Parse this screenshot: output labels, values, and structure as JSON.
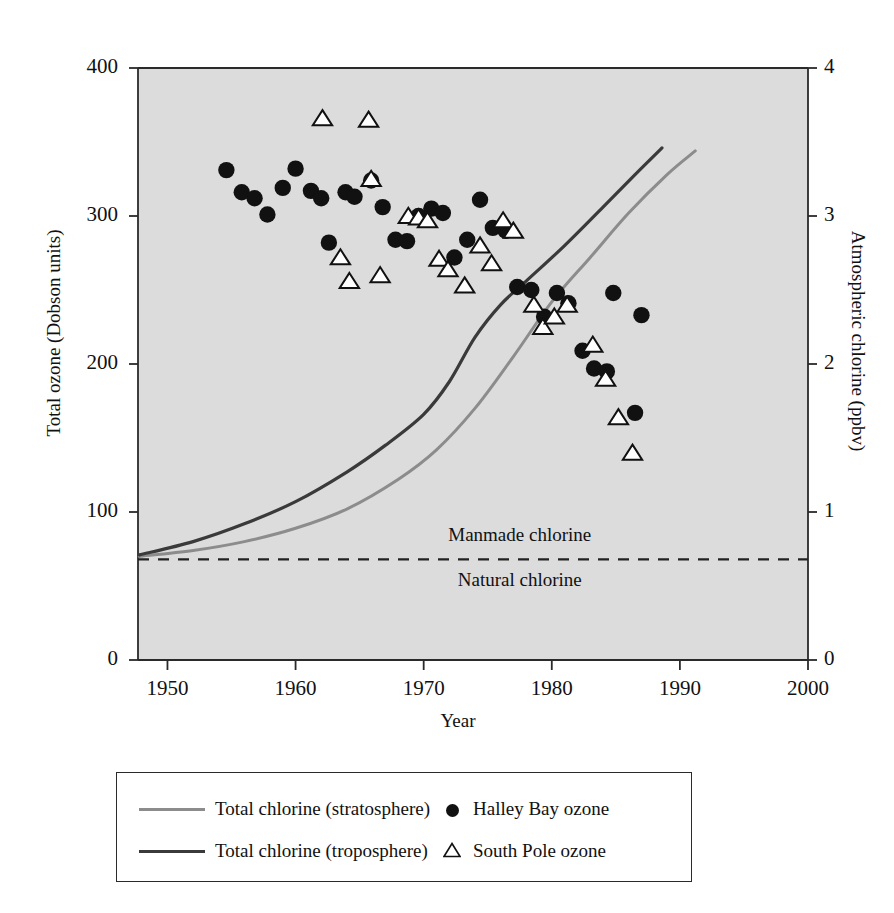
{
  "chart_data": {
    "type": "scatter",
    "title": "",
    "xlabel": "Year",
    "ylabel_left": "Total ozone (Dobson units)",
    "ylabel_right": "Atmospheric chlorine (ppbv)",
    "xlim": [
      1947.7,
      2000
    ],
    "ylim_left": [
      0,
      400
    ],
    "ylim_right": [
      0,
      4
    ],
    "xticks": [
      1950,
      1960,
      1970,
      1980,
      1990,
      2000
    ],
    "xtick_labels": [
      "1950",
      "1960",
      "1970",
      "1980",
      "1990",
      "2000"
    ],
    "yticks_left": [
      0,
      100,
      200,
      300,
      400
    ],
    "ytick_labels_left": [
      "0",
      "100",
      "200",
      "300",
      "400"
    ],
    "yticks_right": [
      0,
      1,
      2,
      3,
      4
    ],
    "ytick_labels_right": [
      "0",
      "1",
      "2",
      "3",
      "4"
    ],
    "grid": false,
    "plot_background": "#dcdcdc",
    "legend_position": "below-plot",
    "annotations": [
      {
        "text": "Manmade chlorine",
        "x": 1977.5,
        "y_right": 0.83
      },
      {
        "text": "Natural chlorine",
        "x": 1977.5,
        "y_right": 0.53
      }
    ],
    "reference_lines": [
      {
        "name": "natural-chlorine-level",
        "y_right": 0.68,
        "style": "dashed",
        "color": "#222222"
      }
    ],
    "series": [
      {
        "name": "Halley Bay ozone",
        "type": "scatter",
        "marker": "filled-circle",
        "color": "#111111",
        "axis": "left",
        "points": [
          [
            1954.6,
            331
          ],
          [
            1955.8,
            316
          ],
          [
            1956.8,
            312
          ],
          [
            1957.8,
            301
          ],
          [
            1959.0,
            319
          ],
          [
            1960.0,
            332
          ],
          [
            1961.2,
            317
          ],
          [
            1962.0,
            312
          ],
          [
            1962.6,
            282
          ],
          [
            1963.9,
            316
          ],
          [
            1964.6,
            313
          ],
          [
            1965.9,
            324
          ],
          [
            1966.8,
            306
          ],
          [
            1967.8,
            284
          ],
          [
            1968.7,
            283
          ],
          [
            1969.6,
            300
          ],
          [
            1970.6,
            305
          ],
          [
            1971.5,
            302
          ],
          [
            1972.4,
            272
          ],
          [
            1973.4,
            284
          ],
          [
            1974.4,
            311
          ],
          [
            1975.4,
            292
          ],
          [
            1976.4,
            290
          ],
          [
            1977.3,
            252
          ],
          [
            1978.4,
            250
          ],
          [
            1979.4,
            232
          ],
          [
            1980.4,
            248
          ],
          [
            1981.3,
            241
          ],
          [
            1982.4,
            209
          ],
          [
            1983.3,
            197
          ],
          [
            1984.3,
            195
          ],
          [
            1984.8,
            248
          ],
          [
            1986.5,
            167
          ],
          [
            1987.0,
            233
          ]
        ]
      },
      {
        "name": "South Pole ozone",
        "type": "scatter",
        "marker": "open-triangle",
        "color": "#111111",
        "axis": "left",
        "points": [
          [
            1962.1,
            366
          ],
          [
            1965.7,
            365
          ],
          [
            1963.5,
            272
          ],
          [
            1964.2,
            256
          ],
          [
            1965.9,
            325
          ],
          [
            1966.6,
            260
          ],
          [
            1968.8,
            300
          ],
          [
            1969.6,
            299
          ],
          [
            1970.3,
            297
          ],
          [
            1971.2,
            271
          ],
          [
            1971.9,
            264
          ],
          [
            1973.2,
            253
          ],
          [
            1974.4,
            280
          ],
          [
            1975.3,
            268
          ],
          [
            1976.2,
            297
          ],
          [
            1977.0,
            290
          ],
          [
            1978.6,
            240
          ],
          [
            1979.3,
            225
          ],
          [
            1980.2,
            232
          ],
          [
            1981.2,
            240
          ],
          [
            1983.2,
            213
          ],
          [
            1984.2,
            190
          ],
          [
            1985.2,
            164
          ],
          [
            1986.3,
            140
          ]
        ]
      },
      {
        "name": "Total chlorine (stratosphere)",
        "type": "line",
        "color": "#8c8c8c",
        "axis": "right",
        "points": [
          [
            1947.8,
            0.7
          ],
          [
            1952.0,
            0.74
          ],
          [
            1956.0,
            0.8
          ],
          [
            1960.0,
            0.89
          ],
          [
            1964.0,
            1.02
          ],
          [
            1968.0,
            1.22
          ],
          [
            1971.0,
            1.42
          ],
          [
            1974.0,
            1.7
          ],
          [
            1977.0,
            2.05
          ],
          [
            1980.0,
            2.42
          ],
          [
            1983.0,
            2.72
          ],
          [
            1986.0,
            3.02
          ],
          [
            1989.0,
            3.28
          ],
          [
            1991.2,
            3.44
          ]
        ]
      },
      {
        "name": "Total chlorine (troposphere)",
        "type": "line",
        "color": "#3a3a3a",
        "axis": "right",
        "points": [
          [
            1947.8,
            0.71
          ],
          [
            1952.0,
            0.8
          ],
          [
            1956.0,
            0.92
          ],
          [
            1960.0,
            1.07
          ],
          [
            1964.0,
            1.27
          ],
          [
            1967.0,
            1.45
          ],
          [
            1970.0,
            1.66
          ],
          [
            1972.0,
            1.88
          ],
          [
            1974.0,
            2.18
          ],
          [
            1976.0,
            2.4
          ],
          [
            1978.0,
            2.56
          ],
          [
            1981.0,
            2.8
          ],
          [
            1984.0,
            3.06
          ],
          [
            1986.5,
            3.28
          ],
          [
            1988.6,
            3.46
          ]
        ]
      }
    ]
  },
  "axes": {
    "left_title": "Total ozone (Dobson units)",
    "right_title": "Atmospheric chlorine (ppbv)",
    "x_title": "Year"
  },
  "legend": {
    "items": [
      {
        "label": "Total chlorine (stratosphere)",
        "marker": "line",
        "color": "#8c8c8c"
      },
      {
        "label": "Total chlorine (troposphere)",
        "marker": "line",
        "color": "#3a3a3a"
      },
      {
        "label": "Halley Bay ozone",
        "marker": "filled-circle",
        "color": "#111111"
      },
      {
        "label": "South Pole ozone",
        "marker": "open-triangle",
        "color": "#111111"
      }
    ]
  },
  "annotations": {
    "manmade": "Manmade chlorine",
    "natural": "Natural chlorine"
  }
}
